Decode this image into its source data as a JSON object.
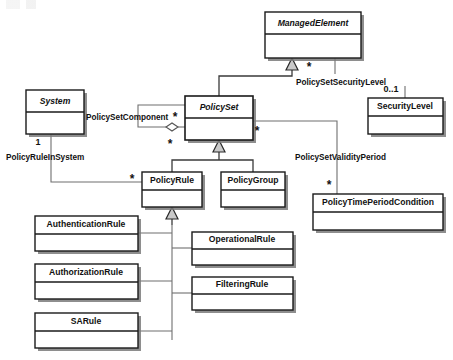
{
  "diagram": {
    "type": "uml-class-diagram",
    "width": 453,
    "height": 360,
    "background_color": "#ffffff",
    "line_color": "#6f6f6f",
    "box_fill": "#ffffff",
    "box_stroke": "#1a1a1a",
    "shadow_color": "#7a7a7a"
  },
  "classes": [
    {
      "id": "managed-element",
      "name": "ManagedElement",
      "abstract": true,
      "x": 265,
      "y": 12,
      "w": 96,
      "h": 46,
      "header_h": 22,
      "shadow": true
    },
    {
      "id": "security-level",
      "name": "SecurityLevel",
      "abstract": false,
      "x": 368,
      "y": 98,
      "w": 75,
      "h": 36,
      "header_h": 18,
      "shadow": true
    },
    {
      "id": "system",
      "name": "System",
      "abstract": true,
      "x": 26,
      "y": 90,
      "w": 58,
      "h": 44,
      "header_h": 22,
      "shadow": true
    },
    {
      "id": "policy-set",
      "name": "PolicySet",
      "abstract": true,
      "x": 185,
      "y": 96,
      "w": 68,
      "h": 44,
      "header_h": 22,
      "shadow": true
    },
    {
      "id": "policy-rule",
      "name": "PolicyRule",
      "abstract": false,
      "x": 142,
      "y": 172,
      "w": 60,
      "h": 35,
      "header_h": 18,
      "shadow": true
    },
    {
      "id": "policy-group",
      "name": "PolicyGroup",
      "abstract": false,
      "x": 221,
      "y": 172,
      "w": 64,
      "h": 35,
      "header_h": 18,
      "shadow": true
    },
    {
      "id": "policy-time-period-condition",
      "name": "PolicyTimePeriodCondition",
      "abstract": false,
      "x": 313,
      "y": 194,
      "w": 130,
      "h": 36,
      "header_h": 18,
      "shadow": true
    },
    {
      "id": "authentication-rule",
      "name": "AuthenticationRule",
      "abstract": false,
      "x": 35,
      "y": 216,
      "w": 103,
      "h": 35,
      "header_h": 18,
      "shadow": true
    },
    {
      "id": "operational-rule",
      "name": "OperationalRule",
      "abstract": false,
      "x": 192,
      "y": 232,
      "w": 101,
      "h": 33,
      "header_h": 17,
      "shadow": true
    },
    {
      "id": "authorization-rule",
      "name": "AuthorizationRule",
      "abstract": false,
      "x": 35,
      "y": 264,
      "w": 103,
      "h": 35,
      "header_h": 18,
      "shadow": true
    },
    {
      "id": "filtering-rule",
      "name": "FilteringRule",
      "abstract": false,
      "x": 192,
      "y": 277,
      "w": 101,
      "h": 33,
      "header_h": 17,
      "shadow": true
    },
    {
      "id": "sa-rule",
      "name": "SARule",
      "abstract": false,
      "x": 35,
      "y": 313,
      "w": 103,
      "h": 35,
      "header_h": 18,
      "shadow": true
    }
  ],
  "associations": [
    {
      "id": "policy-set-security-level",
      "label": "PolicySetSecurityLevel",
      "label_x": 296,
      "label_y": 83,
      "from": "managed-element",
      "to": "security-level",
      "source_multiplicity": "*",
      "target_multiplicity": "0..1"
    },
    {
      "id": "policy-set-component",
      "label": "PolicySetComponent",
      "label_x": 86,
      "label_y": 118,
      "from": "policy-set",
      "to": "policy-set",
      "source_multiplicity": "*",
      "target_multiplicity": "*"
    },
    {
      "id": "policy-rule-in-system",
      "label": "PolicyRuleInSystem",
      "label_x": 6,
      "label_y": 158,
      "from": "system",
      "to": "policy-rule",
      "source_multiplicity": "1",
      "target_multiplicity": "*"
    },
    {
      "id": "policy-set-validity-period",
      "label": "PolicySetValidityPeriod",
      "label_x": 295,
      "label_y": 158,
      "from": "policy-set",
      "to": "policy-time-period-condition",
      "source_multiplicity": "*",
      "target_multiplicity": "*"
    }
  ],
  "multiplicity_markers": [
    {
      "id": "mult-me-star",
      "text": "*",
      "x": 309,
      "y": 68
    },
    {
      "id": "mult-sl-0-1",
      "text": "0..1",
      "x": 391,
      "y": 90
    },
    {
      "id": "mult-psc-star-top",
      "text": "*",
      "x": 175,
      "y": 118
    },
    {
      "id": "mult-psc-star-bottom",
      "text": "*",
      "x": 170,
      "y": 145
    },
    {
      "id": "mult-ps-right-star",
      "text": "*",
      "x": 257,
      "y": 132
    },
    {
      "id": "mult-system-one",
      "text": "1",
      "x": 38,
      "y": 143
    },
    {
      "id": "mult-policy-rule-star",
      "text": "*",
      "x": 132,
      "y": 180
    },
    {
      "id": "mult-ptpc-star",
      "text": "*",
      "x": 329,
      "y": 186
    }
  ],
  "generalizations": [
    {
      "id": "gen-policyset-managedelement",
      "child": "policy-set",
      "parent": "managed-element"
    },
    {
      "id": "gen-policyrule-policyset",
      "child": "policy-rule",
      "parent": "policy-set"
    },
    {
      "id": "gen-policygroup-policyset",
      "child": "policy-group",
      "parent": "policy-set"
    },
    {
      "id": "gen-authenticationrule-policyrule",
      "child": "authentication-rule",
      "parent": "policy-rule"
    },
    {
      "id": "gen-authorizationrule-policyrule",
      "child": "authorization-rule",
      "parent": "policy-rule"
    },
    {
      "id": "gen-sarule-policyrule",
      "child": "sa-rule",
      "parent": "policy-rule"
    },
    {
      "id": "gen-operationalrule-policyrule",
      "child": "operational-rule",
      "parent": "policy-rule"
    },
    {
      "id": "gen-filteringrule-policyrule",
      "child": "filtering-rule",
      "parent": "policy-rule"
    }
  ]
}
